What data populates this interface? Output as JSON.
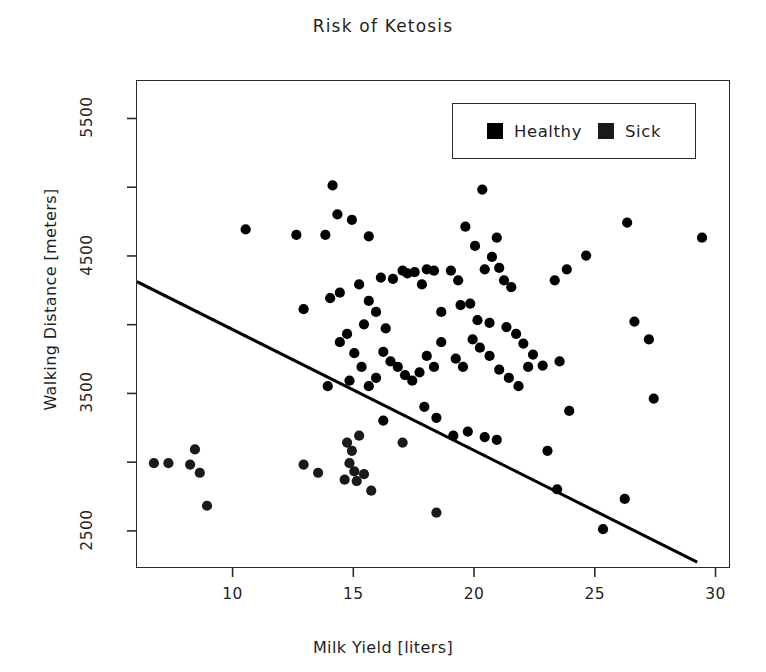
{
  "chart_data": {
    "type": "scatter",
    "title": "Risk of Ketosis",
    "xlabel": "Milk Yield [liters]",
    "ylabel": "Walking Distance [meters]",
    "xlim": [
      6.0,
      30.6
    ],
    "ylim": [
      2230,
      5780
    ],
    "xticks": [
      10,
      15,
      20,
      25,
      30
    ],
    "xtick_labels": [
      "10",
      "15",
      "20",
      "25",
      "30"
    ],
    "yticks": [
      2500,
      3000,
      3500,
      4000,
      4500,
      5000,
      5500
    ],
    "ytick_labels": [
      "2500",
      "",
      "3500",
      "",
      "4500",
      "",
      "5500"
    ],
    "ytick_labeled": [
      2500,
      3500,
      4500,
      5500
    ],
    "grid": false,
    "legend_position": "top-right",
    "marker": "filled-circle",
    "marker_size_px": 9,
    "colors": {
      "healthy": "#000000",
      "sick": "#1a1a1a",
      "axis": "#2b2b2b",
      "trendline": "#000000",
      "background": "#ffffff"
    },
    "legend": [
      {
        "label": "Healthy",
        "color": "#000000",
        "marker": "square"
      },
      {
        "label": "Sick",
        "color": "#1a1a1a",
        "marker": "square"
      }
    ],
    "trendline": {
      "label": "regression line",
      "x_start": 6.0,
      "y_start": 4320,
      "x_end": 29.2,
      "y_end": 2280,
      "color": "#000000",
      "width_px": 3
    },
    "series": [
      {
        "name": "Healthy",
        "color": "#000000",
        "points": [
          [
            10.5,
            4700
          ],
          [
            12.6,
            4660
          ],
          [
            13.8,
            4660
          ],
          [
            14.1,
            5020
          ],
          [
            14.3,
            4810
          ],
          [
            14.9,
            4770
          ],
          [
            15.6,
            4650
          ],
          [
            14.0,
            4200
          ],
          [
            12.9,
            4120
          ],
          [
            14.4,
            4240
          ],
          [
            15.2,
            4300
          ],
          [
            15.4,
            4010
          ],
          [
            15.6,
            4180
          ],
          [
            15.9,
            4100
          ],
          [
            16.1,
            4350
          ],
          [
            16.3,
            3980
          ],
          [
            16.6,
            4340
          ],
          [
            17.0,
            4400
          ],
          [
            17.2,
            4380
          ],
          [
            17.5,
            4390
          ],
          [
            17.8,
            4300
          ],
          [
            18.0,
            4410
          ],
          [
            18.3,
            4400
          ],
          [
            18.6,
            4100
          ],
          [
            19.0,
            4400
          ],
          [
            19.3,
            4330
          ],
          [
            19.6,
            4720
          ],
          [
            20.0,
            4580
          ],
          [
            20.3,
            4990
          ],
          [
            20.4,
            4410
          ],
          [
            20.7,
            4500
          ],
          [
            21.0,
            4420
          ],
          [
            21.2,
            4330
          ],
          [
            21.5,
            4280
          ],
          [
            20.9,
            4640
          ],
          [
            19.4,
            4150
          ],
          [
            19.8,
            4160
          ],
          [
            20.1,
            4040
          ],
          [
            20.6,
            4020
          ],
          [
            21.3,
            3990
          ],
          [
            21.7,
            3940
          ],
          [
            22.0,
            3870
          ],
          [
            22.4,
            3790
          ],
          [
            22.8,
            3710
          ],
          [
            23.3,
            4330
          ],
          [
            23.8,
            4410
          ],
          [
            24.6,
            4510
          ],
          [
            26.3,
            4750
          ],
          [
            26.6,
            4030
          ],
          [
            27.2,
            3900
          ],
          [
            27.4,
            3470
          ],
          [
            29.4,
            4640
          ],
          [
            16.2,
            3810
          ],
          [
            16.5,
            3740
          ],
          [
            16.8,
            3700
          ],
          [
            17.1,
            3640
          ],
          [
            17.4,
            3600
          ],
          [
            17.7,
            3660
          ],
          [
            18.0,
            3780
          ],
          [
            18.3,
            3700
          ],
          [
            18.6,
            3880
          ],
          [
            15.9,
            3620
          ],
          [
            15.6,
            3560
          ],
          [
            15.3,
            3700
          ],
          [
            15.0,
            3800
          ],
          [
            14.7,
            3940
          ],
          [
            14.4,
            3880
          ],
          [
            14.8,
            3600
          ],
          [
            19.2,
            3760
          ],
          [
            19.5,
            3700
          ],
          [
            19.9,
            3900
          ],
          [
            20.2,
            3840
          ],
          [
            20.6,
            3780
          ],
          [
            21.0,
            3680
          ],
          [
            21.4,
            3620
          ],
          [
            21.8,
            3560
          ],
          [
            22.2,
            3700
          ],
          [
            23.5,
            3740
          ],
          [
            23.9,
            3380
          ],
          [
            13.9,
            3560
          ],
          [
            17.9,
            3410
          ],
          [
            18.4,
            3330
          ],
          [
            19.1,
            3200
          ],
          [
            19.7,
            3230
          ],
          [
            20.4,
            3190
          ],
          [
            20.9,
            3170
          ],
          [
            23.0,
            3090
          ],
          [
            23.4,
            2810
          ],
          [
            25.3,
            2520
          ],
          [
            26.2,
            2740
          ],
          [
            16.2,
            3310
          ]
        ]
      },
      {
        "name": "Sick",
        "color": "#1a1a1a",
        "points": [
          [
            6.7,
            3000
          ],
          [
            7.3,
            3000
          ],
          [
            8.2,
            2990
          ],
          [
            8.6,
            2930
          ],
          [
            8.4,
            3100
          ],
          [
            8.9,
            2690
          ],
          [
            12.9,
            2990
          ],
          [
            13.5,
            2930
          ],
          [
            14.7,
            3150
          ],
          [
            14.9,
            3090
          ],
          [
            14.8,
            3000
          ],
          [
            15.0,
            2940
          ],
          [
            15.2,
            3200
          ],
          [
            15.1,
            2870
          ],
          [
            14.6,
            2880
          ],
          [
            15.4,
            2920
          ],
          [
            15.7,
            2800
          ],
          [
            17.0,
            3150
          ],
          [
            18.4,
            2640
          ]
        ]
      }
    ]
  },
  "legend_box": {
    "healthy_label": "Healthy",
    "sick_label": "Sick"
  }
}
